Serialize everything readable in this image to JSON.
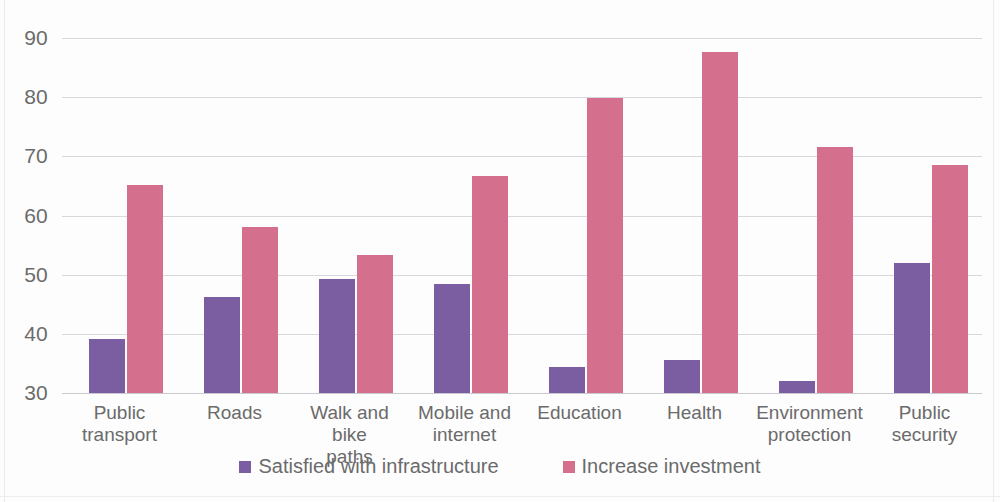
{
  "chart_data": {
    "type": "bar",
    "title": "",
    "subtitle": "",
    "xlabel": "",
    "ylabel": "",
    "ylim": [
      30,
      90
    ],
    "yticks": [
      30,
      40,
      50,
      60,
      70,
      80,
      90
    ],
    "ytick_labels": [
      "30",
      "40",
      "50",
      "60",
      "70",
      "80",
      "90"
    ],
    "grid": true,
    "legend_position": "bottom",
    "categories": [
      "Public transport",
      "Roads",
      "Walk and bike paths",
      "Mobile and internet",
      "Education",
      "Health",
      "Environment protection",
      "Public security"
    ],
    "category_labels": [
      "Public\ntransport",
      "Roads",
      "Walk and bike\npaths",
      "Mobile and\ninternet",
      "Education",
      "Health",
      "Environment\nprotection",
      "Public security"
    ],
    "series": [
      {
        "name": "Satisfied with infrastructure",
        "color": "#7b5ea2",
        "values": [
          39.2,
          46.3,
          49.2,
          48.4,
          34.4,
          35.5,
          32.1,
          51.9
        ]
      },
      {
        "name": "Increase investment",
        "color": "#d4708e",
        "values": [
          65.1,
          58.1,
          53.4,
          66.7,
          79.8,
          87.6,
          71.5,
          68.6
        ]
      }
    ]
  },
  "legend": {
    "items": [
      {
        "label": "Satisfied with infrastructure",
        "color": "#7b5ea2"
      },
      {
        "label": "Increase investment",
        "color": "#d4708e"
      }
    ]
  },
  "axis": {
    "grid_color": "#d8d8dc",
    "tick_color": "#6b6b6b"
  }
}
